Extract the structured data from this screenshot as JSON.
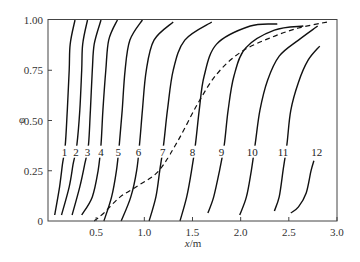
{
  "chart_data": {
    "type": "line",
    "title": "",
    "xlabel": "x/m",
    "ylabel": "φ",
    "xlim": [
      0,
      3.0
    ],
    "ylim": [
      0,
      1.0
    ],
    "grid": false,
    "legend": "none (curves labeled inline 1–12)",
    "x_ticks": [
      "0.5",
      "1.0",
      "1.5",
      "2.0",
      "2.5",
      "3.0"
    ],
    "y_ticks": [
      "0",
      "0.25",
      "0.50",
      "0.75",
      "1.00"
    ],
    "series": [
      {
        "name": "1",
        "style": "solid",
        "label_pos": [
          0.17,
          0.33
        ],
        "points": [
          [
            0.07,
            0.03
          ],
          [
            0.12,
            0.17
          ],
          [
            0.15,
            0.28
          ],
          [
            0.18,
            0.38
          ],
          [
            0.2,
            0.55
          ],
          [
            0.22,
            0.75
          ],
          [
            0.23,
            0.88
          ],
          [
            0.28,
            1.0
          ]
        ]
      },
      {
        "name": "2",
        "style": "solid",
        "label_pos": [
          0.29,
          0.33
        ],
        "points": [
          [
            0.14,
            0.03
          ],
          [
            0.22,
            0.17
          ],
          [
            0.26,
            0.28
          ],
          [
            0.3,
            0.38
          ],
          [
            0.33,
            0.55
          ],
          [
            0.35,
            0.75
          ],
          [
            0.36,
            0.88
          ],
          [
            0.41,
            1.0
          ]
        ]
      },
      {
        "name": "3",
        "style": "solid",
        "label_pos": [
          0.41,
          0.33
        ],
        "points": [
          [
            0.25,
            0.03
          ],
          [
            0.33,
            0.17
          ],
          [
            0.38,
            0.28
          ],
          [
            0.42,
            0.38
          ],
          [
            0.44,
            0.55
          ],
          [
            0.46,
            0.75
          ],
          [
            0.48,
            0.88
          ],
          [
            0.55,
            1.0
          ]
        ]
      },
      {
        "name": "4",
        "style": "solid",
        "label_pos": [
          0.55,
          0.33
        ],
        "points": [
          [
            0.35,
            0.03
          ],
          [
            0.46,
            0.12
          ],
          [
            0.52,
            0.25
          ],
          [
            0.55,
            0.38
          ],
          [
            0.57,
            0.55
          ],
          [
            0.6,
            0.75
          ],
          [
            0.63,
            0.9
          ],
          [
            0.72,
            1.0
          ]
        ]
      },
      {
        "name": "5",
        "style": "solid",
        "label_pos": [
          0.73,
          0.33
        ],
        "points": [
          [
            0.58,
            0.0
          ],
          [
            0.66,
            0.12
          ],
          [
            0.71,
            0.25
          ],
          [
            0.74,
            0.38
          ],
          [
            0.77,
            0.55
          ],
          [
            0.8,
            0.75
          ],
          [
            0.85,
            0.9
          ],
          [
            0.98,
            1.0
          ]
        ]
      },
      {
        "name": "6",
        "style": "solid",
        "label_pos": [
          0.94,
          0.33
        ],
        "points": [
          [
            0.76,
            0.0
          ],
          [
            0.86,
            0.12
          ],
          [
            0.92,
            0.25
          ],
          [
            0.95,
            0.38
          ],
          [
            0.98,
            0.55
          ],
          [
            1.02,
            0.75
          ],
          [
            1.1,
            0.9
          ],
          [
            1.3,
            0.99
          ]
        ]
      },
      {
        "name": "7",
        "style": "solid",
        "label_pos": [
          1.19,
          0.33
        ],
        "points": [
          [
            1.05,
            0.0
          ],
          [
            1.12,
            0.12
          ],
          [
            1.16,
            0.25
          ],
          [
            1.2,
            0.38
          ],
          [
            1.24,
            0.55
          ],
          [
            1.3,
            0.75
          ],
          [
            1.42,
            0.9
          ],
          [
            1.7,
            0.99
          ]
        ]
      },
      {
        "name": "8",
        "style": "solid",
        "label_pos": [
          1.5,
          0.33
        ],
        "points": [
          [
            1.37,
            0.0
          ],
          [
            1.44,
            0.12
          ],
          [
            1.49,
            0.25
          ],
          [
            1.53,
            0.38
          ],
          [
            1.57,
            0.55
          ],
          [
            1.62,
            0.72
          ],
          [
            1.75,
            0.88
          ],
          [
            2.1,
            0.97
          ],
          [
            2.38,
            0.98
          ]
        ]
      },
      {
        "name": "9",
        "style": "solid",
        "label_pos": [
          1.8,
          0.33
        ],
        "points": [
          [
            1.66,
            0.04
          ],
          [
            1.72,
            0.12
          ],
          [
            1.78,
            0.25
          ],
          [
            1.83,
            0.38
          ],
          [
            1.87,
            0.55
          ],
          [
            1.93,
            0.72
          ],
          [
            2.05,
            0.86
          ],
          [
            2.35,
            0.95
          ],
          [
            2.65,
            0.97
          ]
        ]
      },
      {
        "name": "10",
        "style": "solid",
        "label_pos": [
          2.12,
          0.33
        ],
        "points": [
          [
            1.99,
            0.03
          ],
          [
            2.06,
            0.12
          ],
          [
            2.11,
            0.25
          ],
          [
            2.15,
            0.38
          ],
          [
            2.2,
            0.55
          ],
          [
            2.28,
            0.7
          ],
          [
            2.4,
            0.82
          ],
          [
            2.6,
            0.9
          ],
          [
            2.8,
            0.97
          ]
        ]
      },
      {
        "name": "11",
        "style": "solid",
        "label_pos": [
          2.44,
          0.33
        ],
        "points": [
          [
            2.35,
            0.05
          ],
          [
            2.4,
            0.12
          ],
          [
            2.44,
            0.25
          ],
          [
            2.48,
            0.38
          ],
          [
            2.52,
            0.55
          ],
          [
            2.6,
            0.69
          ],
          [
            2.7,
            0.8
          ],
          [
            2.82,
            0.87
          ]
        ]
      },
      {
        "name": "12",
        "style": "solid",
        "label_pos": [
          2.79,
          0.33
        ],
        "points": [
          [
            2.52,
            0.04
          ],
          [
            2.6,
            0.07
          ],
          [
            2.68,
            0.14
          ],
          [
            2.73,
            0.25
          ],
          [
            2.76,
            0.3
          ]
        ]
      },
      {
        "name": "envelope",
        "style": "dashed",
        "points": [
          [
            0.48,
            0.0
          ],
          [
            0.58,
            0.04
          ],
          [
            0.75,
            0.12
          ],
          [
            0.95,
            0.18
          ],
          [
            1.15,
            0.25
          ],
          [
            1.35,
            0.4
          ],
          [
            1.55,
            0.58
          ],
          [
            1.75,
            0.73
          ],
          [
            2.0,
            0.84
          ],
          [
            2.3,
            0.91
          ],
          [
            2.6,
            0.96
          ],
          [
            2.9,
            0.99
          ]
        ]
      }
    ]
  },
  "axes": {
    "xlabel_italic": "x",
    "xlabel_unit": "/m",
    "ylabel": "φ",
    "x_ticks": [
      {
        "v": 0.5,
        "label": "0.5"
      },
      {
        "v": 1.0,
        "label": "1.0"
      },
      {
        "v": 1.5,
        "label": "1.5"
      },
      {
        "v": 2.0,
        "label": "2.0"
      },
      {
        "v": 2.5,
        "label": "2.5"
      },
      {
        "v": 3.0,
        "label": "3.0"
      }
    ],
    "y_ticks": [
      {
        "v": 0,
        "label": "0"
      },
      {
        "v": 0.25,
        "label": "0.25"
      },
      {
        "v": 0.5,
        "label": "0.50"
      },
      {
        "v": 0.75,
        "label": "0.75"
      },
      {
        "v": 1.0,
        "label": "1.00"
      }
    ]
  }
}
